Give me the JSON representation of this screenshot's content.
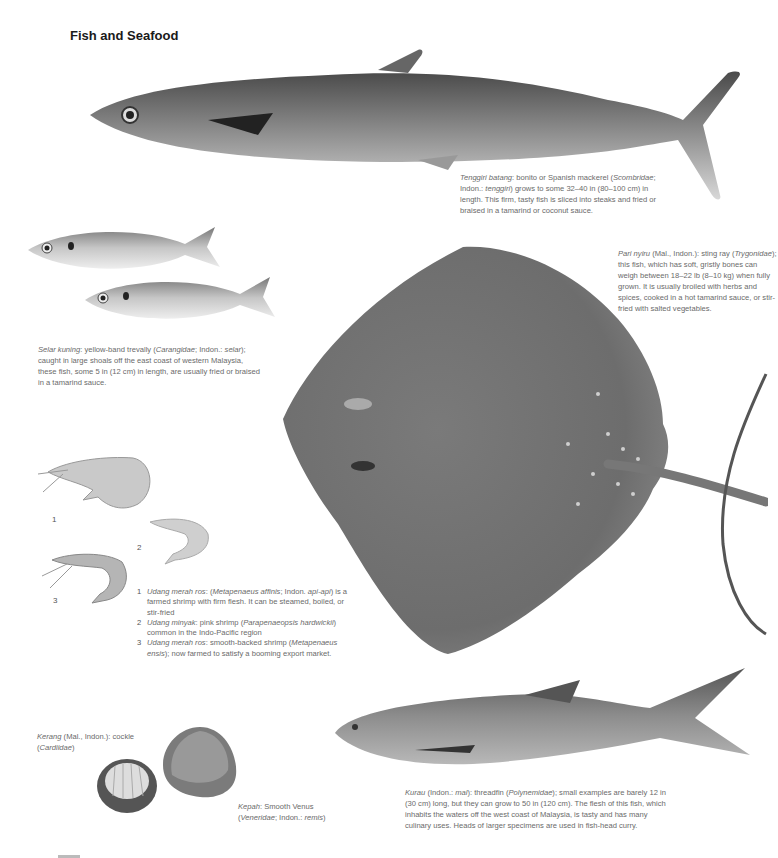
{
  "page": {
    "title": "Fish and Seafood"
  },
  "captions": {
    "tenggiri": {
      "name": "Tenggiri batang",
      "text1": ": bonito or Spanish mackerel (",
      "family": "Scombridae",
      "text2": "; Indon.: ",
      "local": "tenggiri",
      "text3": ") grows to some 32–40 in (80–100 cm) in length. This firm, tasty fish is sliced into steaks and fried or braised in a tamarind or coconut sauce."
    },
    "pari": {
      "name": "Pari nyiru",
      "text1": " (Mal., Indon.): sting ray (",
      "family": "Trygonidae",
      "text2": "); this fish, which has soft, gristly bones can weigh between 18–22 lb (8–10 kg) when fully grown. It is usually broiled with herbs and spices, cooked in a hot tamarind sauce, or stir-fried with salted vegetables."
    },
    "selar": {
      "name": "Selar kuning",
      "text1": ":  yellow-band trevally (",
      "family": "Carangidae",
      "text2": "; Indon.: ",
      "local": "selar",
      "text3": "); caught in large shoals off the east coast of western Malaysia, these fish, some 5 in (12 cm) in length, are usually fried or braised in a tamarind sauce."
    },
    "shrimp": [
      {
        "n": "1",
        "name": "Udang merah ros",
        "text1": ": (",
        "sci": "Metapenaeus affinis",
        "text2": "; Indon. ",
        "local": "api-api",
        "text3": ") is a farmed shrimp with firm flesh. It can be steamed, boiled, or stir-fried"
      },
      {
        "n": "2",
        "name": "Udang minyak",
        "text1": ": pink shrimp (",
        "sci": "Parapenaeopsis hardwickii",
        "text2": ") common in the Indo-Pacific region",
        "local": "",
        "text3": ""
      },
      {
        "n": "3",
        "name": "Udang merah ros",
        "text1": ": smooth-backed shrimp (",
        "sci": "Metapenaeus ensis",
        "text2": "); now farmed to satisfy a booming export market.",
        "local": "",
        "text3": ""
      }
    ],
    "kerang": {
      "name": "Kerang",
      "text1": " (Mal., Indon.): cockle (",
      "family": "Cardiidae",
      "text2": ")"
    },
    "kepah": {
      "name": "Kepah",
      "text1": ": Smooth Venus (",
      "family": "Veneridae",
      "text2": "; Indon.: ",
      "local": "remis",
      "text3": ")"
    },
    "kurau": {
      "name": "Kurau",
      "text1": " (Indon.: ",
      "local": "mal",
      "text2": "): threadfin (",
      "family": "Polynemidae",
      "text3": "); small examples are barely 12 in (30 cm) long, but they can grow to 50 in (120 cm). The flesh of this fish, which inhabits the waters off the west coast of Malaysia, is tasty and has many culinary uses. Heads of larger specimens are used in fish-head curry."
    }
  },
  "shrimp_labels": [
    "1",
    "2",
    "3"
  ]
}
